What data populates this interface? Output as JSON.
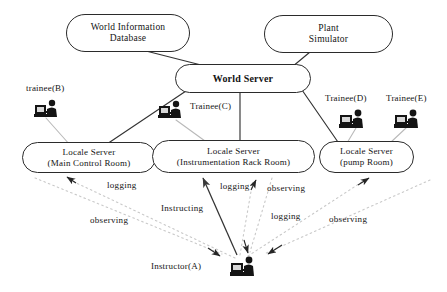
{
  "diagram": {
    "colors": {
      "node_border": "#2b2b2b",
      "solid_link": "#333333",
      "gray_link": "#b9b9b9",
      "dotted_link": "#c9c9c9",
      "text": "#141414",
      "background": "#ffffff"
    },
    "nodes": [
      {
        "id": "world-information-database",
        "name": "world-information-database-node",
        "lines": [
          "World Information",
          "Database"
        ],
        "x": 66,
        "y": 14,
        "w": 124,
        "h": 38,
        "font_size": 9.5
      },
      {
        "id": "plant-simulator",
        "name": "plant-simulator-node",
        "lines": [
          "Plant",
          "Simulator"
        ],
        "x": 264,
        "y": 15,
        "w": 129,
        "h": 38,
        "font_size": 9.5
      },
      {
        "id": "world-server",
        "name": "world-server-node",
        "lines": [
          "World Server"
        ],
        "x": 175,
        "y": 64,
        "w": 136,
        "h": 29,
        "font_size": 10
      },
      {
        "id": "locale-server-main-control-room",
        "name": "locale-server-main-control-room-node",
        "lines": [
          "Locale Server",
          "(Main Control Room)"
        ],
        "x": 22,
        "y": 142,
        "w": 134,
        "h": 31,
        "font_size": 9
      },
      {
        "id": "locale-server-instrumentation-rack-room",
        "name": "locale-server-instrumentation-rack-room-node",
        "lines": [
          "Locale Server",
          "(Instrumentation Rack Room)"
        ],
        "x": 152,
        "y": 140,
        "w": 163,
        "h": 33,
        "font_size": 9
      },
      {
        "id": "locale-server-pump-room",
        "name": "locale-server-pump-room-node",
        "lines": [
          "Locale Server",
          "(pump Room)"
        ],
        "x": 319,
        "y": 141,
        "w": 95,
        "h": 32,
        "font_size": 9
      }
    ],
    "actors": [
      {
        "id": "trainee-b",
        "name": "trainee-b",
        "label": "trainee(B)",
        "label_x": 26,
        "label_y": 83,
        "icon_x": 34,
        "icon_y": 98,
        "font_size": 9
      },
      {
        "id": "trainee-c",
        "name": "trainee-c",
        "label": "Trainee(C)",
        "label_x": 190,
        "label_y": 101,
        "icon_x": 158,
        "icon_y": 99,
        "font_size": 9
      },
      {
        "id": "trainee-d",
        "name": "trainee-d",
        "label": "Trainee(D)",
        "label_x": 325,
        "label_y": 93,
        "icon_x": 339,
        "icon_y": 108,
        "font_size": 9
      },
      {
        "id": "trainee-e",
        "name": "trainee-e",
        "label": "Trainee(E)",
        "label_x": 386,
        "label_y": 93,
        "icon_x": 394,
        "icon_y": 108,
        "font_size": 9
      },
      {
        "id": "instructor-a",
        "name": "instructor-a",
        "label": "Instructor(A)",
        "label_x": 151,
        "label_y": 261,
        "icon_x": 230,
        "icon_y": 255,
        "font_size": 9
      }
    ],
    "edge_labels": [
      {
        "id": "logging-left",
        "name": "edge-label-logging-left",
        "text": "logging",
        "x": 107,
        "y": 180,
        "font_size": 9
      },
      {
        "id": "instructing",
        "name": "edge-label-instructing",
        "text": "Instructing",
        "x": 161,
        "y": 203,
        "font_size": 9
      },
      {
        "id": "observing-left",
        "name": "edge-label-observing-left",
        "text": "observing",
        "x": 90,
        "y": 215,
        "font_size": 9
      },
      {
        "id": "logging-mid",
        "name": "edge-label-logging-mid",
        "text": "logging",
        "x": 220,
        "y": 181,
        "font_size": 9
      },
      {
        "id": "observing-mid",
        "name": "edge-label-observing-mid",
        "text": "observing",
        "x": 267,
        "y": 183,
        "font_size": 9
      },
      {
        "id": "logging-right",
        "name": "edge-label-logging-right",
        "text": "logging",
        "x": 271,
        "y": 211,
        "font_size": 9
      },
      {
        "id": "observing-right",
        "name": "edge-label-observing-right",
        "text": "observing",
        "x": 329,
        "y": 214,
        "font_size": 9
      }
    ],
    "links": {
      "backbone": [
        {
          "name": "link-wid-to-world-server",
          "from": "world-information-database",
          "to": "world-server",
          "style": "solid"
        },
        {
          "name": "link-plant-sim-to-world-server",
          "from": "plant-simulator",
          "to": "world-server",
          "style": "solid"
        },
        {
          "name": "link-world-server-to-main-control",
          "from": "world-server",
          "to": "locale-server-main-control-room",
          "style": "solid"
        },
        {
          "name": "link-world-server-to-instrumentation",
          "from": "world-server",
          "to": "locale-server-instrumentation-rack-room",
          "style": "solid"
        },
        {
          "name": "link-world-server-to-pump",
          "from": "world-server",
          "to": "locale-server-pump-room",
          "style": "solid"
        }
      ],
      "trainee_links": [
        {
          "name": "link-trainee-b-to-main-control",
          "from": "trainee-b",
          "to": "locale-server-main-control-room",
          "style": "gray"
        },
        {
          "name": "link-trainee-c-to-instrumentation",
          "from": "trainee-c",
          "to": "locale-server-instrumentation-rack-room",
          "style": "gray"
        },
        {
          "name": "link-trainee-d-to-pump",
          "from": "trainee-d",
          "to": "locale-server-pump-room",
          "style": "gray"
        },
        {
          "name": "link-trainee-e-to-pump",
          "from": "trainee-e",
          "to": "locale-server-pump-room",
          "style": "gray"
        }
      ],
      "instructor_links": [
        {
          "name": "link-instructor-logging-main-control",
          "label": "logging",
          "style": "dotted",
          "direction": "to-locale"
        },
        {
          "name": "link-instructor-observing-main-control",
          "label": "observing",
          "style": "dotted",
          "direction": "to-instructor"
        },
        {
          "name": "link-instructor-instructing-instrumentation",
          "label": "Instructing",
          "style": "solid",
          "direction": "to-locale"
        },
        {
          "name": "link-instructor-logging-instrumentation",
          "label": "logging",
          "style": "dotted",
          "direction": "to-locale"
        },
        {
          "name": "link-instructor-observing-instrumentation",
          "label": "observing",
          "style": "dotted",
          "direction": "to-instructor"
        },
        {
          "name": "link-instructor-logging-pump",
          "label": "logging",
          "style": "dotted",
          "direction": "to-locale"
        },
        {
          "name": "link-instructor-observing-pump",
          "label": "observing",
          "style": "dotted",
          "direction": "to-instructor"
        }
      ]
    }
  }
}
